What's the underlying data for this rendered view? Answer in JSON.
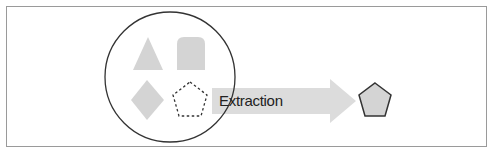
{
  "diagram": {
    "title": "",
    "arrow_label": "Extraction",
    "nodes": [
      {
        "id": "source-set",
        "shape": "circle",
        "contains": [
          "triangle",
          "rounded-tab",
          "diamond",
          "pentagon-dashed"
        ]
      },
      {
        "id": "triangle",
        "shape": "triangle",
        "style": "filled-gray"
      },
      {
        "id": "rounded-tab",
        "shape": "rounded-top-rectangle",
        "style": "filled-gray"
      },
      {
        "id": "diamond",
        "shape": "diamond",
        "style": "filled-gray"
      },
      {
        "id": "pentagon-dashed",
        "shape": "pentagon",
        "style": "dashed-outline"
      },
      {
        "id": "pentagon-result",
        "shape": "pentagon",
        "style": "filled-gray-outlined"
      }
    ],
    "edges": [
      {
        "from": "pentagon-dashed",
        "to": "pentagon-result",
        "label": "Extraction"
      }
    ],
    "colors": {
      "shape_fill": "#d4d4d4",
      "outline": "#333333",
      "arrow_fill": "#dcdcdc",
      "frame_border": "#9a9a9a"
    }
  }
}
